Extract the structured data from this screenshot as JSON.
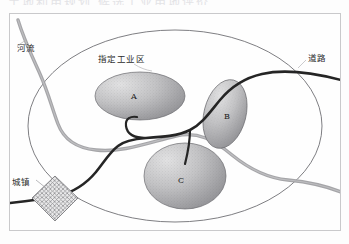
{
  "page": {
    "ghost_header_text": "土地利用规划 候选工业用地评价"
  },
  "legend": {
    "river_label": "河流",
    "road_label": "道路",
    "town_label": "城镇",
    "zone_label": "指定工业区"
  },
  "sites": [
    {
      "id": "A",
      "label": "A",
      "cx": 140,
      "cy": 96,
      "rx": 45,
      "ry": 24,
      "rotate": 0
    },
    {
      "id": "B",
      "label": "B",
      "cx": 225,
      "cy": 114,
      "rx": 21,
      "ry": 35,
      "rotate": 14
    },
    {
      "id": "C",
      "label": "C",
      "cx": 185,
      "cy": 176,
      "rx": 41,
      "ry": 33,
      "rotate": 0
    }
  ],
  "boundary": {
    "name": "study-area-ellipse",
    "cx": 175,
    "cy": 126,
    "rx": 147,
    "ry": 96
  },
  "town": {
    "name": "town-symbol",
    "shape": "diamond-hatched",
    "cx": 55,
    "cy": 198,
    "size": 23
  },
  "colors": {
    "river": "#9a9a9d",
    "road": "#2a2a2a",
    "site_fill_light": "#d9d9da",
    "site_fill_dark": "#8d8d90",
    "boundary_stroke": "#6f6f74",
    "frame_stroke": "#c9c9cb",
    "page_background": "#fdfdfd",
    "text": "#2b2b2b"
  }
}
